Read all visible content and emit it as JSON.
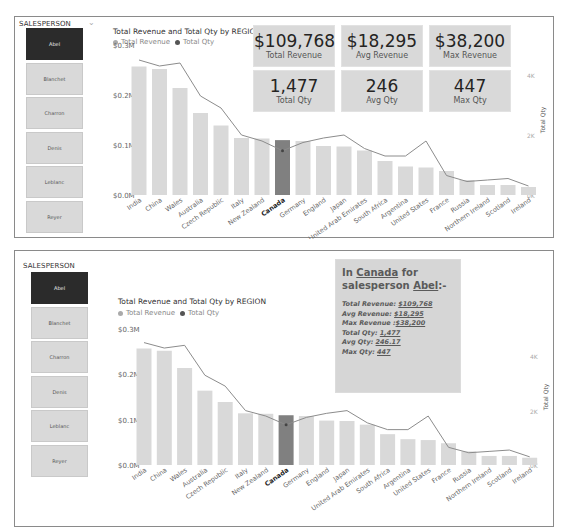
{
  "colors": {
    "bar": "#d9d9d9",
    "bar_selected": "#808080",
    "line": "#8c8c8c",
    "selected_button": "#2b2b2b",
    "button": "#d9d9d9",
    "card": "#d9d9d9"
  },
  "top": {
    "slicer": {
      "title": "SALESPERSON",
      "chevron_icon": "chevron-down-icon",
      "items": [
        "Abel",
        "Blanchet",
        "Charron",
        "Denis",
        "Leblanc",
        "Reyer"
      ],
      "selected": "Abel"
    },
    "chart": {
      "title": "Total Revenue and Total Qty by REGION",
      "legend": [
        "Total Revenue",
        "Total Qty"
      ]
    },
    "cards": [
      {
        "value": "$109,768",
        "label": "Total Revenue"
      },
      {
        "value": "$18,295",
        "label": "Avg Revenue"
      },
      {
        "value": "$38,200",
        "label": "Max Revenue"
      },
      {
        "value": "1,477",
        "label": "Total Qty"
      },
      {
        "value": "246",
        "label": "Avg Qty"
      },
      {
        "value": "447",
        "label": "Max Qty"
      }
    ]
  },
  "bottom": {
    "slicer": {
      "title": "SALESPERSON",
      "items": [
        "Abel",
        "Blanchet",
        "Charron",
        "Denis",
        "Leblanc",
        "Reyer"
      ],
      "selected": "Abel"
    },
    "chart": {
      "title": "Total Revenue and Total Qty by REGION",
      "legend": [
        "Total Revenue",
        "Total Qty"
      ]
    },
    "textbox": {
      "heading_prefix": "In ",
      "heading_region": "Canada",
      "heading_mid": " for",
      "heading_line2_prefix": "salesperson ",
      "heading_person": "Abel",
      "heading_suffix": ":-",
      "lines": [
        {
          "label": "Total Revenue: ",
          "value": "$109,768"
        },
        {
          "label": "Avg Revenue: ",
          "value": "$18,295"
        },
        {
          "label": "Max Revenue :",
          "value": "$38,200"
        },
        {
          "label": "Total Qty: ",
          "value": "1,477"
        },
        {
          "label": "Avg Qty: ",
          "value": "246.17"
        },
        {
          "label": "Max Qty: ",
          "value": "447"
        }
      ]
    }
  },
  "chart_data": [
    {
      "type": "bar",
      "title": "Total Revenue and Total Qty by REGION",
      "xlabel": "REGION",
      "ylabel": "Total Revenue",
      "y2label": "Total Qty",
      "ylim": [
        0,
        300000
      ],
      "y_ticks": [
        "$0.0M",
        "$0.1M",
        "$0.2M",
        "$0.3M"
      ],
      "y2lim": [
        0,
        5000
      ],
      "y2_ticks": [
        "0K",
        "2K",
        "4K"
      ],
      "legend_position": "top-left",
      "highlighted_category": "Canada",
      "categories": [
        "India",
        "China",
        "Wales",
        "Australia",
        "Czech Republic",
        "Italy",
        "New Zealand",
        "Canada",
        "Germany",
        "England",
        "Japan",
        "United Arab Emirates",
        "South Africa",
        "Argentina",
        "United States",
        "France",
        "Russia",
        "Northern Ireland",
        "Scotland",
        "Ireland"
      ],
      "series": [
        {
          "name": "Total Revenue",
          "type": "bar",
          "values": [
            257000,
            252000,
            214000,
            164000,
            139000,
            114000,
            113000,
            109768,
            108000,
            98000,
            97000,
            89000,
            68000,
            57000,
            55000,
            48000,
            30000,
            20000,
            20000,
            16000
          ]
        },
        {
          "name": "Total Qty",
          "type": "line",
          "values": [
            4500,
            4300,
            4400,
            3300,
            2900,
            2000,
            1800,
            1477,
            1750,
            1900,
            2000,
            1550,
            1300,
            1300,
            1800,
            650,
            450,
            500,
            550,
            300
          ]
        }
      ]
    },
    {
      "type": "bar",
      "title": "Total Revenue and Total Qty by REGION",
      "xlabel": "REGION",
      "ylabel": "Total Revenue",
      "y2label": "Total Qty",
      "ylim": [
        0,
        300000
      ],
      "y_ticks": [
        "$0.0M",
        "$0.1M",
        "$0.2M",
        "$0.3M"
      ],
      "y2lim": [
        0,
        5000
      ],
      "y2_ticks": [
        "0K",
        "2K",
        "4K"
      ],
      "legend_position": "top-left",
      "highlighted_category": "Canada",
      "categories": [
        "India",
        "China",
        "Wales",
        "Australia",
        "Czech Republic",
        "Italy",
        "New Zealand",
        "Canada",
        "Germany",
        "England",
        "Japan",
        "United Arab Emirates",
        "South Africa",
        "Argentina",
        "United States",
        "France",
        "Russia",
        "Northern Ireland",
        "Scotland",
        "Ireland"
      ],
      "series": [
        {
          "name": "Total Revenue",
          "type": "bar",
          "values": [
            257000,
            252000,
            214000,
            164000,
            139000,
            114000,
            113000,
            109768,
            108000,
            98000,
            97000,
            89000,
            68000,
            57000,
            55000,
            48000,
            30000,
            20000,
            20000,
            16000
          ]
        },
        {
          "name": "Total Qty",
          "type": "line",
          "values": [
            4500,
            4300,
            4400,
            3300,
            2900,
            2000,
            1800,
            1477,
            1750,
            1900,
            2000,
            1550,
            1300,
            1300,
            1800,
            650,
            450,
            500,
            550,
            300
          ]
        }
      ]
    }
  ]
}
